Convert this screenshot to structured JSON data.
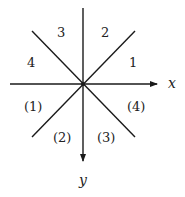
{
  "diagram": {
    "axes": {
      "x_label": "x",
      "y_label": "y"
    },
    "upper_regions": [
      "1",
      "2",
      "3",
      "4"
    ],
    "lower_regions": [
      "(1)",
      "(2)",
      "(3)",
      "(4)"
    ],
    "colors": {
      "stroke": "#1a1a1a",
      "text": "#222222",
      "background": "#ffffff"
    }
  }
}
